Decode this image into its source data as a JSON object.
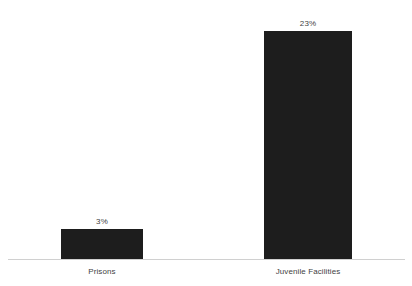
{
  "chart": {
    "background_color": "#ffffff",
    "bar_color": "#1d1d1d",
    "axis_color": "#d0d0d0",
    "text_color": "#3f3f3f"
  },
  "chart_data": {
    "type": "bar",
    "title": "",
    "subtitle": "",
    "xlabel": "",
    "ylabel": "",
    "categories": [
      "Prisons",
      "Juvenile Facilities"
    ],
    "values": [
      3,
      23
    ],
    "value_labels": [
      "3%",
      "23%"
    ],
    "value_unit": "%",
    "ylim": [
      0,
      24.5
    ],
    "grid": false,
    "legend": null,
    "legend_position": "none",
    "annotations": []
  }
}
